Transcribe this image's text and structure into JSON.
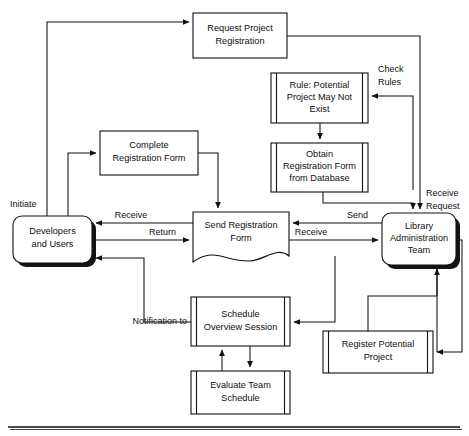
{
  "diagram": {
    "type": "flowchart",
    "background_color": "#ffffff",
    "line_color": "#111111",
    "nodes": [
      {
        "id": "request-project-registration",
        "label_line1": "Request Project",
        "label_line2": "Registration",
        "shape": "rectangle",
        "x": 193,
        "y": 13,
        "w": 94,
        "h": 45
      },
      {
        "id": "rule-potential-project",
        "label_line1": "Rule: Potential",
        "label_line2": "Project May Not",
        "label_line3": "Exist",
        "shape": "double-bar-rectangle",
        "x": 271,
        "y": 73,
        "w": 97,
        "h": 50
      },
      {
        "id": "obtain-registration-form",
        "label_line1": "Obtain",
        "label_line2": "Registration Form",
        "label_line3": "from Database",
        "shape": "double-bar-rectangle",
        "x": 271,
        "y": 143,
        "w": 97,
        "h": 49
      },
      {
        "id": "complete-registration-form",
        "label_line1": "Complete",
        "label_line2": "Registration Form",
        "shape": "rectangle",
        "x": 100,
        "y": 131,
        "w": 98,
        "h": 44
      },
      {
        "id": "developers-and-users",
        "label_line1": "Developers",
        "label_line2": "and Users",
        "shape": "rounded-shadow",
        "x": 13,
        "y": 216,
        "w": 79,
        "h": 47
      },
      {
        "id": "send-registration-form",
        "label_line1": "Send Registration",
        "label_line2": "Form",
        "shape": "document-wavy",
        "x": 193,
        "y": 212,
        "w": 96,
        "h": 52
      },
      {
        "id": "library-administration-team",
        "label_line1": "Library",
        "label_line2": "Administration",
        "label_line3": "Team",
        "shape": "rounded-shadow",
        "x": 382,
        "y": 213,
        "w": 74,
        "h": 52
      },
      {
        "id": "schedule-overview-session",
        "label_line1": "Schedule",
        "label_line2": "Overview Session",
        "shape": "double-bar-rectangle",
        "x": 191,
        "y": 297,
        "w": 99,
        "h": 49
      },
      {
        "id": "evaluate-team-schedule",
        "label_line1": "Evaluate Team",
        "label_line2": "Schedule",
        "shape": "double-bar-rectangle",
        "x": 191,
        "y": 371,
        "w": 99,
        "h": 43
      },
      {
        "id": "register-potential-project",
        "label_line1": "Register Potential",
        "label_line2": "Project",
        "shape": "double-bar-rectangle",
        "x": 323,
        "y": 331,
        "w": 110,
        "h": 42
      }
    ],
    "edge_labels": [
      {
        "id": "initiate",
        "text": "Initiate",
        "x": 10,
        "y": 205,
        "anchor": "start"
      },
      {
        "id": "check-rules-1",
        "text": "Check",
        "x": 378,
        "y": 70,
        "anchor": "start"
      },
      {
        "id": "check-rules-2",
        "text": "Rules",
        "x": 378,
        "y": 83,
        "anchor": "start"
      },
      {
        "id": "receive-request-1",
        "text": "Receive",
        "x": 426,
        "y": 194,
        "anchor": "start"
      },
      {
        "id": "receive-request-2",
        "text": "Request",
        "x": 426,
        "y": 207,
        "anchor": "start"
      },
      {
        "id": "receive-left",
        "text": "Receive",
        "x": 131,
        "y": 218,
        "anchor": "middle"
      },
      {
        "id": "return",
        "text": "Return",
        "x": 174,
        "y": 236,
        "anchor": "end"
      },
      {
        "id": "send-right",
        "text": "Send",
        "x": 368,
        "y": 218,
        "anchor": "end"
      },
      {
        "id": "receive-right",
        "text": "Receive",
        "x": 310,
        "y": 236,
        "anchor": "middle"
      },
      {
        "id": "notification-to",
        "text": "Notification to",
        "x": 185,
        "y": 322,
        "anchor": "end"
      }
    ]
  }
}
